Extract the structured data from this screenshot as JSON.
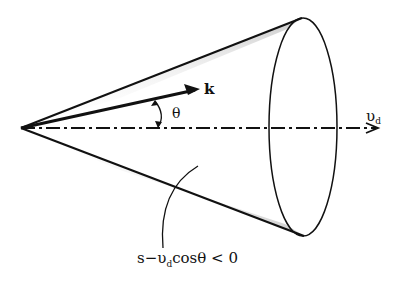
{
  "diagram": {
    "type": "cone",
    "labels": {
      "wave_vector": "k",
      "angle": "θ",
      "drift_velocity": "υ",
      "drift_velocity_sub": "d",
      "condition_prefix": "s−υ",
      "condition_sub": "d",
      "condition_suffix": "cosθ < 0"
    },
    "colors": {
      "line": "#111111",
      "shade": "#9a9a9a",
      "background": "#ffffff"
    }
  }
}
